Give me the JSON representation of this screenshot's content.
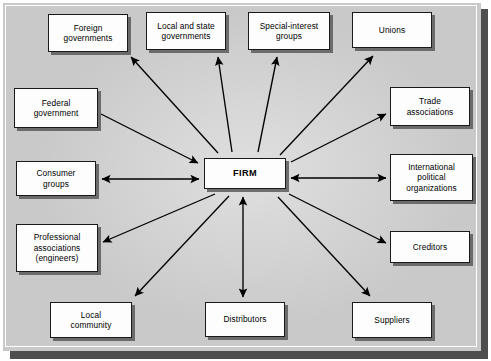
{
  "diagram": {
    "center": {
      "id": "firm",
      "label": "FIRM",
      "box": {
        "x": 204,
        "y": 158,
        "w": 82,
        "h": 31
      }
    },
    "colors": {
      "panel_background": "#c9c9c9",
      "panel_shadow": "#4e4e4e",
      "node_fill": "#fdfdfd",
      "node_border": "#1a1a1a",
      "node_shadow": "#5a5a5a",
      "arrow": "#000000",
      "text": "#000000"
    },
    "nodes": [
      {
        "id": "foreign-governments",
        "label": "Foreign\ngovernments",
        "box": {
          "x": 48,
          "y": 14,
          "w": 80,
          "h": 38
        }
      },
      {
        "id": "local-state-governments",
        "label": "Local and state\ngovernments",
        "box": {
          "x": 146,
          "y": 12,
          "w": 80,
          "h": 38
        }
      },
      {
        "id": "special-interest-groups",
        "label": "Special-interest\ngroups",
        "box": {
          "x": 248,
          "y": 12,
          "w": 82,
          "h": 38
        }
      },
      {
        "id": "unions",
        "label": "Unions",
        "box": {
          "x": 352,
          "y": 12,
          "w": 80,
          "h": 36
        }
      },
      {
        "id": "federal-government",
        "label": "Federal\ngovernment",
        "box": {
          "x": 14,
          "y": 88,
          "w": 84,
          "h": 40
        }
      },
      {
        "id": "trade-associations",
        "label": "Trade\nassociations",
        "box": {
          "x": 390,
          "y": 87,
          "w": 80,
          "h": 39
        }
      },
      {
        "id": "consumer-groups",
        "label": "Consumer\ngroups",
        "box": {
          "x": 16,
          "y": 161,
          "w": 80,
          "h": 35
        }
      },
      {
        "id": "international-political-organizations",
        "label": "International\npolitical\norganizations",
        "box": {
          "x": 390,
          "y": 154,
          "w": 83,
          "h": 47
        }
      },
      {
        "id": "professional-associations",
        "label": "Professional\nassociations\n(engineers)",
        "box": {
          "x": 16,
          "y": 224,
          "w": 82,
          "h": 48
        }
      },
      {
        "id": "creditors",
        "label": "Creditors",
        "box": {
          "x": 390,
          "y": 231,
          "w": 80,
          "h": 32
        }
      },
      {
        "id": "local-community",
        "label": "Local\ncommunity",
        "box": {
          "x": 50,
          "y": 302,
          "w": 82,
          "h": 36
        }
      },
      {
        "id": "distributors",
        "label": "Distributors",
        "box": {
          "x": 205,
          "y": 302,
          "w": 80,
          "h": 35
        }
      },
      {
        "id": "suppliers",
        "label": "Suppliers",
        "box": {
          "x": 352,
          "y": 302,
          "w": 80,
          "h": 36
        }
      }
    ],
    "connections": [
      {
        "from": "firm",
        "to": "foreign-governments",
        "direction": "outward",
        "x1": 218,
        "y1": 153,
        "x2": 131,
        "y2": 57
      },
      {
        "from": "firm",
        "to": "local-state-governments",
        "direction": "outward",
        "x1": 232,
        "y1": 152,
        "x2": 218,
        "y2": 57
      },
      {
        "from": "firm",
        "to": "special-interest-groups",
        "direction": "outward",
        "x1": 258,
        "y1": 152,
        "x2": 277,
        "y2": 57
      },
      {
        "from": "firm",
        "to": "unions",
        "direction": "outward",
        "x1": 280,
        "y1": 155,
        "x2": 373,
        "y2": 56
      },
      {
        "from": "firm",
        "to": "federal-government",
        "direction": "inward",
        "x1": 101,
        "y1": 114,
        "x2": 198,
        "y2": 163
      },
      {
        "from": "firm",
        "to": "trade-associations",
        "direction": "outward",
        "x1": 291,
        "y1": 162,
        "x2": 386,
        "y2": 114
      },
      {
        "from": "firm",
        "to": "consumer-groups",
        "direction": "bidirectional",
        "x1": 102,
        "y1": 179,
        "x2": 199,
        "y2": 179
      },
      {
        "from": "firm",
        "to": "international-political-organizations",
        "direction": "bidirectional",
        "x1": 291,
        "y1": 178,
        "x2": 386,
        "y2": 178
      },
      {
        "from": "firm",
        "to": "professional-associations",
        "direction": "outward",
        "x1": 215,
        "y1": 194,
        "x2": 103,
        "y2": 242
      },
      {
        "from": "firm",
        "to": "creditors",
        "direction": "outward",
        "x1": 289,
        "y1": 194,
        "x2": 386,
        "y2": 243
      },
      {
        "from": "firm",
        "to": "local-community",
        "direction": "outward",
        "x1": 229,
        "y1": 196,
        "x2": 135,
        "y2": 296
      },
      {
        "from": "firm",
        "to": "distributors",
        "direction": "bidirectional",
        "x1": 243,
        "y1": 197,
        "x2": 243,
        "y2": 297
      },
      {
        "from": "firm",
        "to": "suppliers",
        "direction": "outward",
        "x1": 278,
        "y1": 197,
        "x2": 370,
        "y2": 296
      }
    ]
  }
}
